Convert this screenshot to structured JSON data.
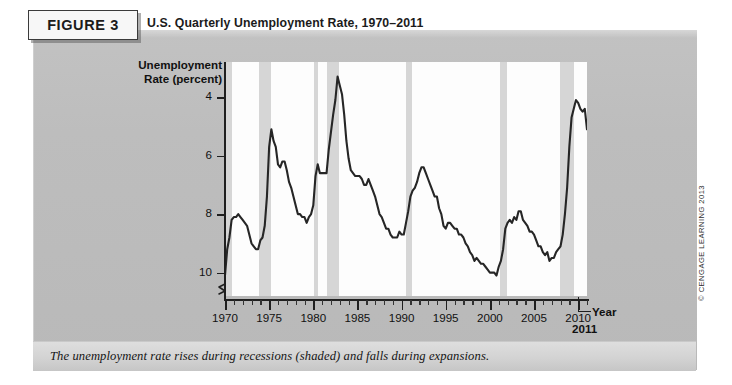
{
  "figure": {
    "badge": "FIGURE 3",
    "title": "U.S. Quarterly Unemployment Rate, 1970–2011",
    "caption": "The unemployment rate rises during recessions (shaded) and falls during expansions.",
    "copyright": "© CENGAGE LEARNING 2013"
  },
  "axis": {
    "ylabel_line1": "Unemployment",
    "ylabel_line2": "Rate (percent)",
    "xlabel": "Year",
    "end_year": "2011",
    "y_ticks": [
      "10",
      "8",
      "6",
      "4"
    ],
    "x_ticks": [
      "1970",
      "1975",
      "1980",
      "1985",
      "1990",
      "1995",
      "2000",
      "2005",
      "2010"
    ]
  },
  "chart_data": {
    "type": "line",
    "title": "U.S. Quarterly Unemployment Rate, 1970–2011",
    "xlabel": "Year",
    "ylabel": "Unemployment Rate (percent)",
    "xlim": [
      1970,
      2011
    ],
    "ylim": [
      3.2,
      11.2
    ],
    "y_ticks": [
      4,
      6,
      8,
      10
    ],
    "x_ticks": [
      1970,
      1975,
      1980,
      1985,
      1990,
      1995,
      2000,
      2005,
      2010
    ],
    "y_axis_break": true,
    "grid": false,
    "legend": null,
    "line_color": "#262626",
    "band_color": "#d6d6d6",
    "plot_background": "#fdfdfd",
    "recession_bands": [
      {
        "label": "1969-1970 recession",
        "start": 1969.9,
        "end": 1970.8
      },
      {
        "label": "1973-1975 recession",
        "start": 1973.9,
        "end": 1975.2
      },
      {
        "label": "1980 recession",
        "start": 1980.1,
        "end": 1980.5
      },
      {
        "label": "1981-1982 recession",
        "start": 1981.5,
        "end": 1982.9
      },
      {
        "label": "1990-1991 recession",
        "start": 1990.5,
        "end": 1991.2
      },
      {
        "label": "2001 recession",
        "start": 2001.2,
        "end": 2001.9
      },
      {
        "label": "2007-2009 recession",
        "start": 2007.9,
        "end": 2009.5
      }
    ],
    "series": [
      {
        "name": "U.S. Quarterly Unemployment Rate",
        "x": [
          1970.0,
          1970.25,
          1970.5,
          1970.75,
          1971.0,
          1971.25,
          1971.5,
          1971.75,
          1972.0,
          1972.25,
          1972.5,
          1972.75,
          1973.0,
          1973.25,
          1973.5,
          1973.75,
          1974.0,
          1974.25,
          1974.5,
          1974.75,
          1975.0,
          1975.25,
          1975.5,
          1975.75,
          1976.0,
          1976.25,
          1976.5,
          1976.75,
          1977.0,
          1977.25,
          1977.5,
          1977.75,
          1978.0,
          1978.25,
          1978.5,
          1978.75,
          1979.0,
          1979.25,
          1979.5,
          1979.75,
          1980.0,
          1980.25,
          1980.5,
          1980.75,
          1981.0,
          1981.25,
          1981.5,
          1981.75,
          1982.0,
          1982.25,
          1982.5,
          1982.75,
          1983.0,
          1983.25,
          1983.5,
          1983.75,
          1984.0,
          1984.25,
          1984.5,
          1984.75,
          1985.0,
          1985.25,
          1985.5,
          1985.75,
          1986.0,
          1986.25,
          1986.5,
          1986.75,
          1987.0,
          1987.25,
          1987.5,
          1987.75,
          1988.0,
          1988.25,
          1988.5,
          1988.75,
          1989.0,
          1989.25,
          1989.5,
          1989.75,
          1990.0,
          1990.25,
          1990.5,
          1990.75,
          1991.0,
          1991.25,
          1991.5,
          1991.75,
          1992.0,
          1992.25,
          1992.5,
          1992.75,
          1993.0,
          1993.25,
          1993.5,
          1993.75,
          1994.0,
          1994.25,
          1994.5,
          1994.75,
          1995.0,
          1995.25,
          1995.5,
          1995.75,
          1996.0,
          1996.25,
          1996.5,
          1996.75,
          1997.0,
          1997.25,
          1997.5,
          1997.75,
          1998.0,
          1998.25,
          1998.5,
          1998.75,
          1999.0,
          1999.25,
          1999.5,
          1999.75,
          2000.0,
          2000.25,
          2000.5,
          2000.75,
          2001.0,
          2001.25,
          2001.5,
          2001.75,
          2002.0,
          2002.25,
          2002.5,
          2002.75,
          2003.0,
          2003.25,
          2003.5,
          2003.75,
          2004.0,
          2004.25,
          2004.5,
          2004.75,
          2005.0,
          2005.25,
          2005.5,
          2005.75,
          2006.0,
          2006.25,
          2006.5,
          2006.75,
          2007.0,
          2007.25,
          2007.5,
          2007.75,
          2008.0,
          2008.25,
          2008.5,
          2008.75,
          2009.0,
          2009.25,
          2009.5,
          2009.75,
          2010.0,
          2010.25,
          2010.5,
          2010.75,
          2011.0,
          2011.25,
          2011.5
        ],
        "y": [
          3.9,
          4.8,
          5.2,
          5.8,
          5.9,
          5.9,
          6.0,
          5.9,
          5.8,
          5.7,
          5.6,
          5.3,
          5.0,
          4.9,
          4.8,
          4.8,
          5.1,
          5.2,
          5.6,
          6.6,
          8.3,
          8.9,
          8.5,
          8.3,
          7.7,
          7.6,
          7.8,
          7.8,
          7.5,
          7.1,
          6.9,
          6.6,
          6.3,
          6.0,
          6.0,
          5.9,
          5.9,
          5.7,
          5.9,
          6.0,
          6.3,
          7.3,
          7.7,
          7.4,
          7.4,
          7.4,
          7.4,
          8.2,
          8.8,
          9.4,
          9.9,
          10.7,
          10.4,
          10.1,
          9.4,
          8.5,
          7.9,
          7.5,
          7.4,
          7.3,
          7.3,
          7.3,
          7.2,
          7.0,
          7.0,
          7.2,
          7.0,
          6.8,
          6.6,
          6.3,
          6.0,
          5.9,
          5.7,
          5.5,
          5.5,
          5.3,
          5.2,
          5.2,
          5.2,
          5.4,
          5.3,
          5.3,
          5.7,
          6.1,
          6.6,
          6.8,
          6.9,
          7.1,
          7.4,
          7.6,
          7.6,
          7.4,
          7.2,
          7.0,
          6.8,
          6.6,
          6.6,
          6.2,
          6.0,
          5.6,
          5.5,
          5.7,
          5.7,
          5.6,
          5.5,
          5.5,
          5.3,
          5.3,
          5.2,
          5.0,
          4.9,
          4.7,
          4.6,
          4.4,
          4.5,
          4.4,
          4.3,
          4.3,
          4.2,
          4.1,
          4.0,
          4.0,
          4.0,
          3.9,
          4.2,
          4.4,
          4.8,
          5.5,
          5.7,
          5.8,
          5.7,
          5.9,
          5.8,
          6.1,
          6.1,
          5.8,
          5.7,
          5.6,
          5.4,
          5.4,
          5.3,
          5.1,
          4.9,
          4.9,
          4.7,
          4.6,
          4.7,
          4.4,
          4.5,
          4.5,
          4.7,
          4.8,
          4.9,
          5.3,
          6.0,
          6.9,
          8.3,
          9.3,
          9.6,
          9.9,
          9.8,
          9.6,
          9.5,
          9.6,
          8.9,
          9.1,
          9.1
        ]
      }
    ]
  }
}
